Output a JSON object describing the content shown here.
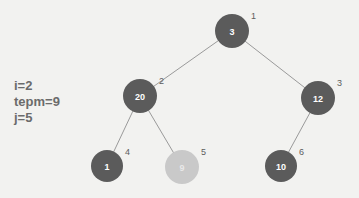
{
  "background_color": "#f2f2f0",
  "variables": {
    "lines": [
      "i=2",
      "tepm=9",
      "j=5"
    ]
  },
  "tree": {
    "node_fill_dark": "#5b5b5b",
    "node_fill_light": "#c9c9c9",
    "edge_color": "#9a9a9a",
    "index_label_color": "#5d5d5d",
    "nodes": [
      {
        "id": "n1",
        "value": "3",
        "index": "1",
        "cx": 232,
        "cy": 31,
        "r": 17,
        "shade": "dark"
      },
      {
        "id": "n2",
        "value": "20",
        "index": "2",
        "cx": 140,
        "cy": 96,
        "r": 17,
        "shade": "dark"
      },
      {
        "id": "n3",
        "value": "12",
        "index": "3",
        "cx": 318,
        "cy": 98,
        "r": 17,
        "shade": "dark"
      },
      {
        "id": "n4",
        "value": "1",
        "index": "4",
        "cx": 107,
        "cy": 166,
        "r": 16,
        "shade": "dark"
      },
      {
        "id": "n5",
        "value": "9",
        "index": "5",
        "cx": 182,
        "cy": 167,
        "r": 17,
        "shade": "light"
      },
      {
        "id": "n6",
        "value": "10",
        "index": "6",
        "cx": 281,
        "cy": 166,
        "r": 16,
        "shade": "dark"
      }
    ],
    "edges": [
      {
        "from": "n1",
        "to": "n2"
      },
      {
        "from": "n1",
        "to": "n3"
      },
      {
        "from": "n2",
        "to": "n4"
      },
      {
        "from": "n2",
        "to": "n5"
      },
      {
        "from": "n3",
        "to": "n6"
      }
    ]
  }
}
